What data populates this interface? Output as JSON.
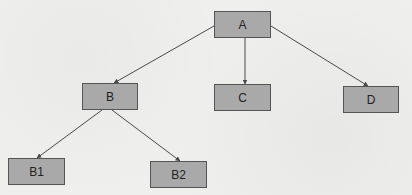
{
  "diagram": {
    "type": "tree",
    "colors": {
      "node_fill": "#a9a9a9",
      "node_border": "#555555",
      "edge": "#4a4a4a",
      "background": "#efefed"
    },
    "nodes": [
      {
        "id": "A",
        "label": "A",
        "x": 214,
        "y": 11,
        "w": 57,
        "h": 27
      },
      {
        "id": "B",
        "label": "B",
        "x": 82,
        "y": 83,
        "w": 56,
        "h": 27
      },
      {
        "id": "C",
        "label": "C",
        "x": 214,
        "y": 84,
        "w": 57,
        "h": 27
      },
      {
        "id": "D",
        "label": "D",
        "x": 343,
        "y": 86,
        "w": 56,
        "h": 27
      },
      {
        "id": "B1",
        "label": "B1",
        "x": 8,
        "y": 158,
        "w": 57,
        "h": 27
      },
      {
        "id": "B2",
        "label": "B2",
        "x": 150,
        "y": 161,
        "w": 57,
        "h": 27
      }
    ],
    "edges": [
      {
        "from": "A",
        "to": "B",
        "x1": 214,
        "y1": 26,
        "x2": 114,
        "y2": 83
      },
      {
        "from": "A",
        "to": "C",
        "x1": 245,
        "y1": 38,
        "x2": 245,
        "y2": 84
      },
      {
        "from": "A",
        "to": "D",
        "x1": 271,
        "y1": 26,
        "x2": 368,
        "y2": 86
      },
      {
        "from": "B",
        "to": "B1",
        "x1": 102,
        "y1": 110,
        "x2": 37,
        "y2": 158
      },
      {
        "from": "B",
        "to": "B2",
        "x1": 112,
        "y1": 110,
        "x2": 180,
        "y2": 161
      }
    ]
  }
}
